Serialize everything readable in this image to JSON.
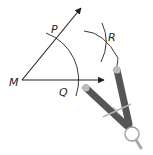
{
  "diagram": {
    "type": "compass-construction",
    "labels": {
      "vertex": "M",
      "point_on_ray": "P",
      "point_on_base": "Q",
      "arc_intersection": "R"
    },
    "colors": {
      "line": "#231f20",
      "compass_leg": "#5a5a5a",
      "compass_head": "#b5b5b5",
      "background": "#ffffff"
    }
  }
}
